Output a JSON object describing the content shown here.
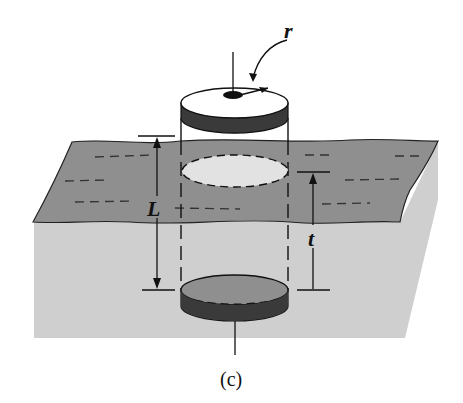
{
  "figure": {
    "caption": "(c)",
    "labels": {
      "radius": "r",
      "length": "L",
      "thickness": "t"
    },
    "colors": {
      "background": "#ffffff",
      "plane": "#8f8f8f",
      "block": "#cfcfcf",
      "disk_band": "#3a3a3a",
      "line": "#111111"
    }
  }
}
